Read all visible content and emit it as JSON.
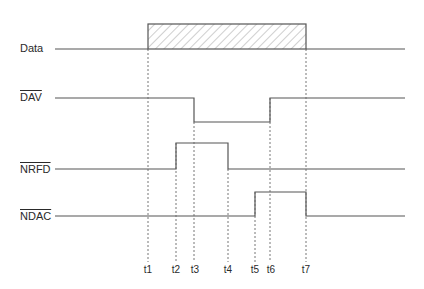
{
  "signals": [
    {
      "name": "Data",
      "overbar": false,
      "label_y": 43
    },
    {
      "name": "DAV",
      "overbar": true,
      "label_y": 92
    },
    {
      "name": "NRFD",
      "overbar": true,
      "label_y": 164
    },
    {
      "name": "NDAC",
      "overbar": true,
      "label_y": 211
    }
  ],
  "time_markers": [
    {
      "label": "t1",
      "x": 148
    },
    {
      "label": "t2",
      "x": 176
    },
    {
      "label": "t3",
      "x": 194
    },
    {
      "label": "t4",
      "x": 228
    },
    {
      "label": "t5",
      "x": 255
    },
    {
      "label": "t6",
      "x": 270
    },
    {
      "label": "t7",
      "x": 306
    }
  ],
  "waveforms": {
    "data": {
      "baseline_y": 49,
      "box_top_y": 24,
      "valid_from": "t1",
      "valid_to": "t7",
      "hatched": true
    },
    "dav": {
      "high_y": 98,
      "low_y": 122,
      "falls_at": "t3",
      "rises_at": "t6"
    },
    "nrfd": {
      "low_y": 169,
      "high_y": 143,
      "rises_at": "t2",
      "falls_at": "t4"
    },
    "ndac": {
      "low_y": 216,
      "high_y": 192,
      "rises_at": "t5",
      "falls_at": "t7"
    }
  },
  "colors": {
    "line": "#555555",
    "dashed": "#666666",
    "text": "#2a2a2a"
  }
}
